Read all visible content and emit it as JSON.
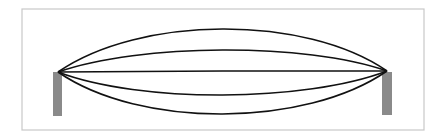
{
  "diagram": {
    "frame": {
      "x": 22,
      "y": 9,
      "w": 402,
      "h": 121,
      "stroke": "#c8c8c8"
    },
    "posts": [
      {
        "name": "left-post",
        "x": 53,
        "y": 72,
        "w": 9,
        "h": 44,
        "fill": "#8a8a8a"
      },
      {
        "name": "right-post",
        "x": 382,
        "y": 72,
        "w": 10,
        "h": 43,
        "fill": "#8a8a8a"
      }
    ],
    "anchors": {
      "left": [
        58,
        72
      ],
      "right": [
        387,
        71
      ]
    },
    "curves": [
      {
        "name": "curve-1",
        "mid_y": 29
      },
      {
        "name": "curve-2",
        "mid_y": 50
      },
      {
        "name": "curve-3",
        "mid_y": 71
      },
      {
        "name": "curve-4",
        "mid_y": 95
      },
      {
        "name": "curve-5",
        "mid_y": 114
      }
    ],
    "curve_color": "#111111"
  }
}
